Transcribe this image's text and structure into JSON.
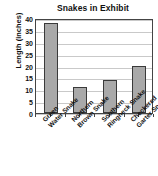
{
  "chart_data": {
    "type": "bar",
    "title": "Snakes in Exhibit",
    "xlabel": "",
    "ylabel": "Length (inches)",
    "categories": [
      "Green Water Snake",
      "Northern Brown Snake",
      "Southern Ringneck Snake",
      "Checkered Garter Snake"
    ],
    "category_lines": [
      [
        "Green",
        "Water Snake"
      ],
      [
        "Northern",
        "Brown Snake"
      ],
      [
        "Southern",
        "Ringneck Snake"
      ],
      [
        "Checkered",
        "Garter Snake"
      ]
    ],
    "values": [
      38,
      11,
      14,
      20
    ],
    "ylim": [
      0,
      40
    ],
    "yticks": [
      0,
      5,
      10,
      15,
      20,
      25,
      30,
      35,
      40
    ],
    "ytick_labels": [
      "0",
      "5",
      "10",
      "15",
      "20",
      "25",
      "30",
      "35",
      "40"
    ],
    "grid": true,
    "legend": "none",
    "bar_color": "#a9a9a9",
    "bar_border_color": "#3a3a3a",
    "axis_color": "#444444",
    "grid_color": "#c9c9c9",
    "background": "#ffffff"
  }
}
